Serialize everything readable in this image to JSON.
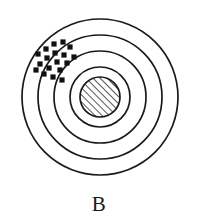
{
  "figure": {
    "caption": "B",
    "type": "concentric-target-scatter"
  },
  "chart_data": {
    "type": "scatter",
    "title": "B",
    "subtitle": "",
    "xlabel": "",
    "ylabel": "",
    "xlim": [
      -100,
      100
    ],
    "ylim": [
      -100,
      100
    ],
    "grid": false,
    "legend": null,
    "center": {
      "cx": 100,
      "cy": 97
    },
    "rings": [
      {
        "name": "ring-outer-4",
        "r": 78,
        "stroke": "#1a1a1a",
        "stroke_width": 1.7,
        "fill": "none"
      },
      {
        "name": "ring-3",
        "r": 62,
        "stroke": "#1a1a1a",
        "stroke_width": 1.7,
        "fill": "none"
      },
      {
        "name": "ring-2",
        "r": 46,
        "stroke": "#1a1a1a",
        "stroke_width": 1.7,
        "fill": "none"
      },
      {
        "name": "ring-1",
        "r": 30,
        "stroke": "#1a1a1a",
        "stroke_width": 1.7,
        "fill": "none"
      },
      {
        "name": "bullseye",
        "r": 20,
        "stroke": "#1a1a1a",
        "stroke_width": 1.7,
        "fill": "hatch-45"
      }
    ],
    "marker": {
      "shape": "square",
      "size": 5.2,
      "color": "#111111",
      "count": 18
    },
    "points": [
      {
        "x": 54,
        "y": 44
      },
      {
        "x": 63,
        "y": 42
      },
      {
        "x": 46,
        "y": 49
      },
      {
        "x": 70,
        "y": 47
      },
      {
        "x": 55,
        "y": 53
      },
      {
        "x": 38,
        "y": 54
      },
      {
        "x": 64,
        "y": 55
      },
      {
        "x": 47,
        "y": 58
      },
      {
        "x": 74,
        "y": 57
      },
      {
        "x": 57,
        "y": 62
      },
      {
        "x": 40,
        "y": 64
      },
      {
        "x": 67,
        "y": 63
      },
      {
        "x": 49,
        "y": 68
      },
      {
        "x": 36,
        "y": 70
      },
      {
        "x": 60,
        "y": 70
      },
      {
        "x": 44,
        "y": 74
      },
      {
        "x": 53,
        "y": 77
      },
      {
        "x": 62,
        "y": 80
      }
    ],
    "colors": {
      "stroke": "#1a1a1a",
      "marker": "#111111",
      "background": "#ffffff",
      "hatch": "#333333"
    }
  }
}
